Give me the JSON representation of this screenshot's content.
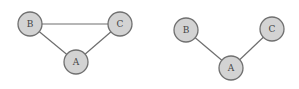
{
  "colors": {
    "node_fill": "#d3d3d3",
    "node_stroke": "#707070",
    "edge": "#6e6e6e",
    "label": "#444444",
    "background": "#ffffff"
  },
  "graphs": [
    {
      "name": "triangle-graph",
      "nodes": [
        {
          "id": "B",
          "label": "B",
          "x": 30,
          "y": 24,
          "r": 12
        },
        {
          "id": "C",
          "label": "C",
          "x": 120,
          "y": 24,
          "r": 12
        },
        {
          "id": "A",
          "label": "A",
          "x": 76,
          "y": 62,
          "r": 12
        }
      ],
      "edges": [
        {
          "from": "B",
          "to": "C"
        },
        {
          "from": "B",
          "to": "A"
        },
        {
          "from": "C",
          "to": "A"
        }
      ]
    },
    {
      "name": "path-graph",
      "nodes": [
        {
          "id": "B",
          "label": "B",
          "x": 186,
          "y": 30,
          "r": 12
        },
        {
          "id": "C",
          "label": "C",
          "x": 272,
          "y": 29,
          "r": 12
        },
        {
          "id": "A",
          "label": "A",
          "x": 231,
          "y": 68,
          "r": 12
        }
      ],
      "edges": [
        {
          "from": "B",
          "to": "A"
        },
        {
          "from": "C",
          "to": "A"
        }
      ]
    }
  ]
}
